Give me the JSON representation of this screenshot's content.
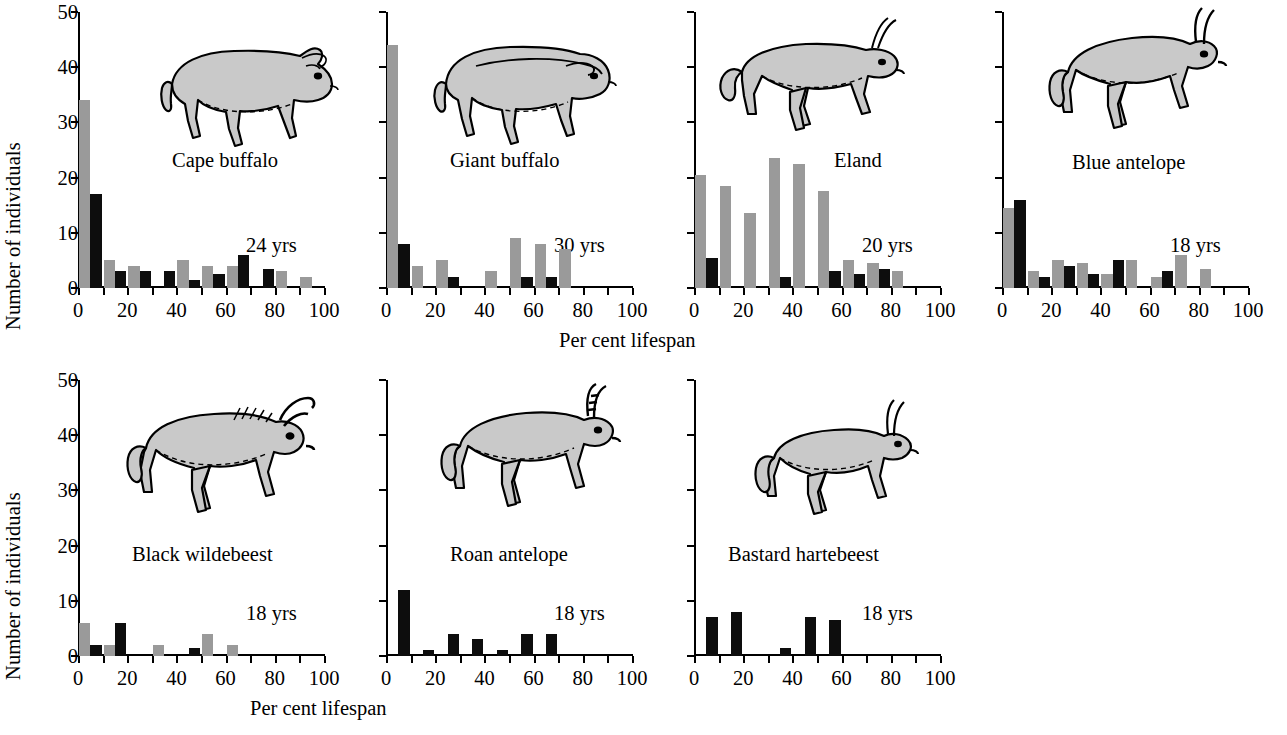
{
  "axes": {
    "ylabel": "Number of individuals",
    "xlabel": "Per cent lifespan",
    "yticks": [
      "0",
      "10",
      "20",
      "30",
      "40",
      "50"
    ],
    "ytick_values": [
      0,
      10,
      20,
      30,
      40,
      50
    ],
    "ylim": [
      0,
      50
    ],
    "xticks": [
      "0",
      "20",
      "40",
      "60",
      "80",
      "100"
    ],
    "xtick_values": [
      0,
      20,
      40,
      60,
      80,
      100
    ],
    "xminor_step": 10,
    "xlim": [
      0,
      100
    ]
  },
  "colors": {
    "gray_series": "#9a9a9a",
    "black_series": "#0d0d0d",
    "axis": "#000000",
    "background": "#ffffff",
    "animal_fill": "#c9c9c9",
    "animal_outline": "#000000"
  },
  "chart_data": {
    "type": "bar",
    "title": "",
    "xlabel": "Per cent lifespan",
    "ylabel": "Number of individuals",
    "xlim": [
      0,
      100
    ],
    "ylim": [
      0,
      50
    ],
    "grid": false,
    "legend": "none",
    "bin_width": 10,
    "bin_starts": [
      0,
      10,
      20,
      30,
      40,
      50,
      60,
      70,
      80,
      90
    ],
    "series_names": [
      "gray",
      "black"
    ],
    "panels": [
      {
        "name": "Cape buffalo",
        "lifespan": "24 yrs",
        "row": 0,
        "col": 0,
        "series": [
          {
            "name": "gray",
            "values": [
              34,
              5,
              4,
              0,
              5,
              4,
              4,
              0,
              3,
              2
            ]
          },
          {
            "name": "black",
            "values": [
              17,
              3,
              3,
              3,
              1.5,
              2.5,
              6,
              3.5,
              0,
              0
            ]
          }
        ]
      },
      {
        "name": "Giant buffalo",
        "lifespan": "30 yrs",
        "row": 0,
        "col": 1,
        "series": [
          {
            "name": "gray",
            "values": [
              44,
              4,
              5,
              0,
              3,
              9,
              8,
              7,
              0,
              0
            ]
          },
          {
            "name": "black",
            "values": [
              8,
              0,
              2,
              0,
              0,
              2,
              2,
              0,
              0,
              0
            ]
          }
        ]
      },
      {
        "name": "Eland",
        "lifespan": "20 yrs",
        "row": 0,
        "col": 2,
        "series": [
          {
            "name": "gray",
            "values": [
              20.5,
              18.5,
              13.5,
              23.5,
              22.5,
              17.5,
              5,
              4.5,
              3,
              0
            ]
          },
          {
            "name": "black",
            "values": [
              5.5,
              0,
              0,
              2,
              0,
              3,
              2.5,
              3.5,
              0,
              0
            ]
          }
        ]
      },
      {
        "name": "Blue antelope",
        "lifespan": "18 yrs",
        "row": 0,
        "col": 3,
        "series": [
          {
            "name": "gray",
            "values": [
              14.5,
              3,
              5,
              4.5,
              2.5,
              5,
              2,
              6,
              3.5,
              0
            ]
          },
          {
            "name": "black",
            "values": [
              16,
              2,
              4,
              2.5,
              5,
              0,
              3,
              0,
              0,
              0
            ]
          }
        ]
      },
      {
        "name": "Black wildebeest",
        "lifespan": "18 yrs",
        "row": 1,
        "col": 0,
        "series": [
          {
            "name": "gray",
            "values": [
              6,
              2,
              0,
              2,
              0,
              4,
              2,
              0,
              0,
              0
            ]
          },
          {
            "name": "black",
            "values": [
              2,
              6,
              0,
              0,
              1.5,
              0,
              0,
              0,
              0,
              0
            ]
          }
        ]
      },
      {
        "name": "Roan antelope",
        "lifespan": "18 yrs",
        "row": 1,
        "col": 1,
        "series": [
          {
            "name": "gray",
            "values": [
              0,
              0,
              0,
              0,
              0,
              0,
              0,
              0,
              0,
              0
            ]
          },
          {
            "name": "black",
            "values": [
              12,
              1,
              4,
              3,
              1,
              4,
              4,
              0,
              0,
              0
            ]
          }
        ]
      },
      {
        "name": "Bastard hartebeest",
        "lifespan": "18 yrs",
        "row": 1,
        "col": 2,
        "series": [
          {
            "name": "gray",
            "values": [
              0,
              0,
              0,
              0,
              0,
              0,
              0,
              0,
              0,
              0
            ]
          },
          {
            "name": "black",
            "values": [
              7,
              8,
              0,
              1.5,
              7,
              6.5,
              0,
              0,
              0,
              0
            ]
          }
        ]
      }
    ]
  },
  "panel_labels": {
    "p0_name": "Cape buffalo",
    "p0_life": "24 yrs",
    "p1_name": "Giant buffalo",
    "p1_life": "30 yrs",
    "p2_name": "Eland",
    "p2_life": "20 yrs",
    "p3_name": "Blue antelope",
    "p3_life": "18 yrs",
    "p4_name": "Black wildebeest",
    "p4_life": "18 yrs",
    "p5_name": "Roan antelope",
    "p5_life": "18 yrs",
    "p6_name": "Bastard hartebeest",
    "p6_life": "18 yrs"
  },
  "icons": {
    "cape_buffalo": "cape-buffalo-silhouette-icon",
    "giant_buffalo": "giant-buffalo-silhouette-icon",
    "eland": "eland-silhouette-icon",
    "blue_antelope": "blue-antelope-silhouette-icon",
    "black_wildebeest": "black-wildebeest-silhouette-icon",
    "roan_antelope": "roan-antelope-silhouette-icon",
    "bastard_hartebeest": "bastard-hartebeest-silhouette-icon"
  }
}
